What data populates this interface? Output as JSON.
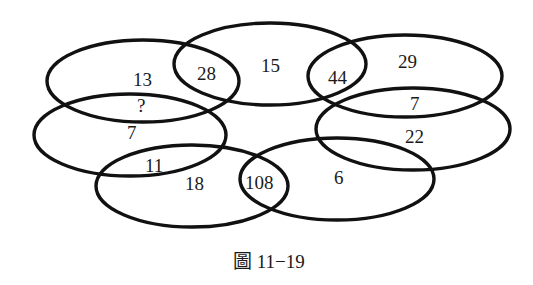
{
  "figure": {
    "caption": "圖 11−19",
    "ellipses": [
      {
        "id": "top-left",
        "cx": 143,
        "cy": 81,
        "rx": 96,
        "ry": 41
      },
      {
        "id": "top-center",
        "cx": 270,
        "cy": 64,
        "rx": 96,
        "ry": 41
      },
      {
        "id": "top-right",
        "cx": 405,
        "cy": 76,
        "rx": 97,
        "ry": 41
      },
      {
        "id": "middle-left",
        "cx": 130,
        "cy": 135,
        "rx": 96,
        "ry": 41
      },
      {
        "id": "middle-right",
        "cx": 413,
        "cy": 129,
        "rx": 97,
        "ry": 41
      },
      {
        "id": "bottom-left",
        "cx": 192,
        "cy": 186,
        "rx": 96,
        "ry": 41
      },
      {
        "id": "bottom-right",
        "cx": 337,
        "cy": 179,
        "rx": 97,
        "ry": 41
      }
    ],
    "labels": {
      "top_left_only": "13",
      "top_left_top_center_overlap": "28",
      "top_center_only": "15",
      "top_center_top_right_overlap": "44",
      "top_right_only": "29",
      "top_left_middle_left_overlap": "?",
      "middle_left_only": "7",
      "top_right_middle_right_overlap": "7",
      "middle_right_only": "22",
      "middle_left_bottom_left_overlap": "11",
      "bottom_left_only": "18",
      "bottom_left_bottom_right_overlap": "108",
      "bottom_right_only": "6"
    }
  }
}
